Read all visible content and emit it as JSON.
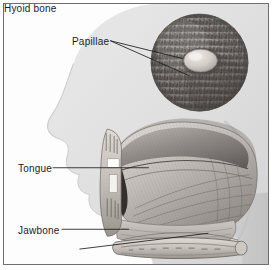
{
  "figure": {
    "background_color": "#ffffff",
    "frame_color": "#6f6f6f",
    "ink_color": "#1b1b1b",
    "style": "grayscale medical illustration"
  },
  "labels": [
    {
      "id": "papillae",
      "text": "Papillae"
    },
    {
      "id": "tongue",
      "text": "Tongue"
    },
    {
      "id": "jawbone",
      "text": "Jawbone"
    },
    {
      "id": "hyoid_bone",
      "text": "Hyoid bone"
    }
  ],
  "label_text": {
    "papillae": "Papillae",
    "tongue": "Tongue",
    "jawbone": "Jawbone",
    "hyoid_bone": "Hyoid bone"
  },
  "inset": {
    "name": "papillae-magnification-circle",
    "shape": "circle",
    "center_x": 197,
    "center_y": 59,
    "radius": 49,
    "contents": "dense filiform papillae surrounding a central circumvallate papilla"
  },
  "leader_lines": {
    "papillae_count": 2,
    "tongue_count": 1,
    "jawbone_count": 1,
    "hyoid_count": 1
  },
  "anatomy": {
    "head_profile": "faint gray lateral head silhouette (forehead, nose, lips, chin, neck)",
    "tongue": "sagittal section of tongue body with longitudinal muscle striations",
    "jawbone": "mandible cross-section with teeth at upper and lower margins",
    "hyoid_bone": "elongated horizontal bone beneath the tongue root"
  },
  "colors": {
    "silhouette": "#dedede",
    "tissue_light": "#d8d4d0",
    "tissue_mid": "#a9a5a2",
    "tissue_dark": "#6b6764",
    "cavity_shadow": "#3a3734",
    "bone": "#cfcac4",
    "highlight": "#ffffff"
  }
}
